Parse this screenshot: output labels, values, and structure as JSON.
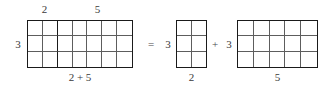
{
  "figure": {
    "colors": {
      "border": "#1a1a1a",
      "gridline": "#5d5d5d",
      "text": "#3a3a3a",
      "background": "#ffffff"
    }
  },
  "sum_rectangle": {
    "rows": 3,
    "cols": 7,
    "split_after_col": 2,
    "top_label_left": "2",
    "top_label_right": "5",
    "left_label": "3",
    "bottom_label": "2 + 5"
  },
  "operators": {
    "equals": "=",
    "plus": "+"
  },
  "rect_a": {
    "rows": 3,
    "cols": 2,
    "left_label": "3",
    "bottom_label": "2"
  },
  "rect_b": {
    "rows": 3,
    "cols": 5,
    "left_label": "3",
    "bottom_label": "5"
  }
}
